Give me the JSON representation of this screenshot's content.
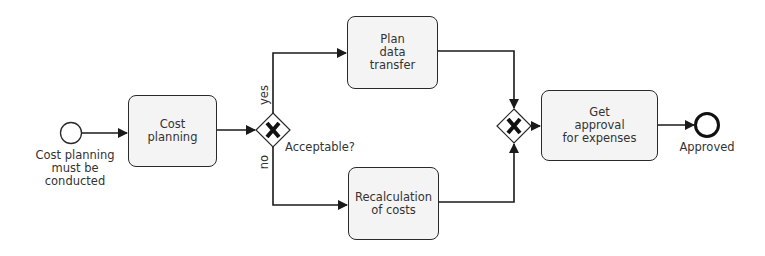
{
  "diagram": {
    "type": "BPMN process",
    "colors": {
      "stroke": "#1a1a1a",
      "task_fill": "#f4f4f4",
      "text": "#333333",
      "background": "#ffffff"
    },
    "start_event": {
      "label": "Cost planning\nmust be\nconducted",
      "icon": "start-event-circle"
    },
    "tasks": [
      {
        "id": "cost_planning",
        "label": "Cost\nplanning"
      },
      {
        "id": "plan_data_transfer",
        "label": "Plan\ndata\ntransfer"
      },
      {
        "id": "recalculation",
        "label": "Recalculation\nof costs"
      },
      {
        "id": "get_approval",
        "label": "Get\napproval\nfor expenses"
      }
    ],
    "gateways": [
      {
        "id": "split",
        "label": "Acceptable?",
        "icon": "exclusive-gateway-x"
      },
      {
        "id": "join",
        "label": "",
        "icon": "exclusive-gateway-x"
      }
    ],
    "flow_labels": {
      "yes": "yes",
      "no": "no"
    },
    "end_event": {
      "label": "Approved",
      "icon": "end-event-circle"
    }
  }
}
